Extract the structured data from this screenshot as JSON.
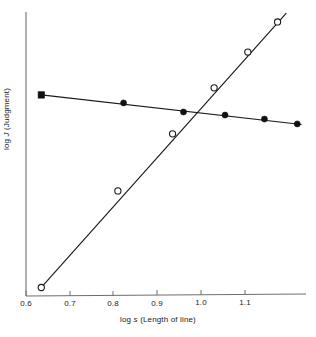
{
  "chart_data": {
    "type": "line",
    "title": "",
    "xlabel": "log s (Length of line)",
    "ylabel": "log J (Judgment)",
    "xlim": [
      0.565,
      1.205
    ],
    "ylim": [
      0.0,
      1.0
    ],
    "xticks": [
      0.6,
      0.7,
      0.8,
      0.9,
      1.0,
      1.1
    ],
    "xticklabels": [
      "0.6",
      "0.7",
      "0.8",
      "0.9",
      "1.0",
      "1.1"
    ],
    "yticks": [],
    "yticklabels": [],
    "grid": false,
    "legend": "none",
    "series": [
      {
        "name": "open-circle-series",
        "marker": "open-circle",
        "slope_description": "steep positive slope, approximately 1.0",
        "points": [
          {
            "x": 0.6,
            "y": 0.03
          },
          {
            "x": 0.775,
            "y": 0.37
          },
          {
            "x": 0.9,
            "y": 0.571
          },
          {
            "x": 0.995,
            "y": 0.733
          },
          {
            "x": 1.072,
            "y": 0.859
          },
          {
            "x": 1.14,
            "y": 0.965
          }
        ],
        "line": [
          {
            "x": 0.6,
            "y": 0.03
          },
          {
            "x": 1.16,
            "y": 0.996
          }
        ]
      },
      {
        "name": "filled-circle-series",
        "marker": "filled-circle",
        "slope_description": "shallow negative slope",
        "points": [
          {
            "x": 0.6,
            "y": 0.708
          },
          {
            "x": 0.788,
            "y": 0.68
          },
          {
            "x": 0.925,
            "y": 0.648
          },
          {
            "x": 1.02,
            "y": 0.637
          },
          {
            "x": 1.11,
            "y": 0.623
          },
          {
            "x": 1.185,
            "y": 0.606
          }
        ],
        "line": [
          {
            "x": 0.6,
            "y": 0.708
          },
          {
            "x": 1.195,
            "y": 0.604
          }
        ]
      }
    ]
  },
  "axis": {
    "x_title_prefix": "log",
    "x_title_symbol": "s",
    "x_title_suffix": "(Length of line)",
    "y_title_prefix": "log",
    "y_title_symbol": "J",
    "y_title_suffix": "(Judgment)"
  }
}
